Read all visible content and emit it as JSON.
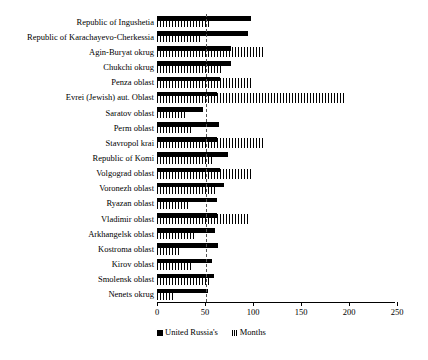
{
  "chart_data": {
    "type": "bar",
    "orientation": "horizontal",
    "title": "",
    "xlabel": "",
    "ylabel": "",
    "xlim": [
      0,
      250
    ],
    "grid": false,
    "legend_position": "bottom",
    "reference_line": 51,
    "xticks": [
      0,
      50,
      100,
      150,
      200,
      250
    ],
    "xtick_labels": [
      "0",
      "50",
      "100",
      "150",
      "200",
      "250"
    ],
    "categories": [
      "Republic of Ingushetia",
      "Republic of Karachayevo-Cherkessia",
      "Agin-Buryat okrug",
      "Chukchi okrug",
      "Penza oblast",
      "Evrei (Jewish) aut. Oblast",
      "Saratov oblast",
      "Perm oblast",
      "Stavropol krai",
      "Republic of Komi",
      "Volgograd oblast",
      "Voronezh oblast",
      "Ryazan oblast",
      "Vladimir oblast",
      "Arkhangelsk oblast",
      "Kostroma oblast",
      "Kirov oblast",
      "Smolensk oblast",
      "Nenets okrug"
    ],
    "series": [
      {
        "name": "United Russia's",
        "style": "solid-black",
        "values": [
          98,
          95,
          77,
          77,
          66,
          62,
          48,
          65,
          63,
          74,
          66,
          70,
          62,
          62,
          60,
          64,
          57,
          59,
          53
        ]
      },
      {
        "name": "Months",
        "style": "hatched",
        "values": [
          54,
          45,
          110,
          68,
          100,
          196,
          31,
          36,
          110,
          57,
          98,
          63,
          32,
          97,
          40,
          25,
          36,
          55,
          17
        ]
      }
    ]
  },
  "legend": {
    "items": [
      {
        "label": "United Russia's"
      },
      {
        "label": "Months"
      }
    ]
  },
  "colors": {
    "series_solid": "#000000",
    "series_hatch": "#000000",
    "axis": "#000000",
    "reference_line": "#555555",
    "background": "#ffffff"
  }
}
